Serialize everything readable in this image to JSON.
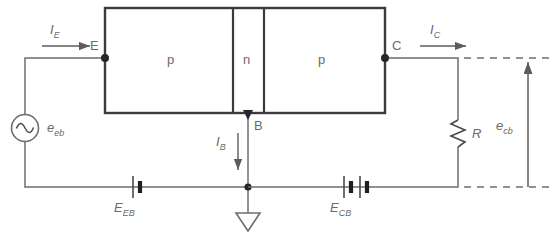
{
  "diagram": {
    "colors": {
      "line": "#6e6e70",
      "device_outline": "#3b3b3d",
      "text": "#59595b",
      "background": "#ffffff"
    },
    "transistor": {
      "regions": [
        {
          "name": "emitter-region",
          "label": "p"
        },
        {
          "name": "base-region",
          "label": "n"
        },
        {
          "name": "collector-region",
          "label": "p"
        }
      ],
      "terminals": [
        {
          "name": "emitter-terminal",
          "label": "E"
        },
        {
          "name": "base-terminal",
          "label": "B"
        },
        {
          "name": "collector-terminal",
          "label": "C"
        }
      ]
    },
    "currents": [
      {
        "name": "emitter-current",
        "symbol": "I",
        "sub": "E",
        "direction": "right"
      },
      {
        "name": "base-current",
        "symbol": "I",
        "sub": "B",
        "direction": "down"
      },
      {
        "name": "collector-current",
        "symbol": "I",
        "sub": "C",
        "direction": "right"
      }
    ],
    "sources": [
      {
        "name": "ac-source",
        "symbol": "e",
        "sub": "eb",
        "type": "ac-sine"
      },
      {
        "name": "emitter-base-battery",
        "symbol": "E",
        "sub": "EB",
        "type": "battery-single-cell"
      },
      {
        "name": "collector-base-battery",
        "symbol": "E",
        "sub": "CB",
        "type": "battery-double-cell"
      }
    ],
    "components": [
      {
        "name": "load-resistor",
        "symbol": "R",
        "type": "resistor-zigzag"
      },
      {
        "name": "ground",
        "type": "ground-triangle"
      }
    ],
    "output": {
      "name": "output-voltage",
      "symbol": "e",
      "sub": "cb",
      "direction": "up"
    }
  }
}
